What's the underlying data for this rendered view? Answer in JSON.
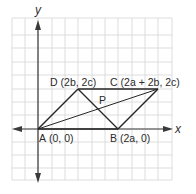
{
  "diagram": {
    "type": "coordinate-plane-parallelogram",
    "axes": {
      "x_label": "x",
      "y_label": "y"
    },
    "points": [
      {
        "id": "A",
        "name": "A",
        "coords": "(0, 0)"
      },
      {
        "id": "B",
        "name": "B",
        "coords": "(2a, 0)"
      },
      {
        "id": "C",
        "name": "C",
        "coords": "(2a + 2b, 2c)"
      },
      {
        "id": "D",
        "name": "D",
        "coords": "(2b, 2c)"
      },
      {
        "id": "P",
        "name": "P",
        "coords": ""
      }
    ],
    "segments": [
      "AB",
      "BC",
      "CD",
      "DA",
      "AC",
      "BD"
    ],
    "colors": {
      "grid": "#cfcfcf",
      "axis": "#3a3a3a",
      "shape": "#2a2a2a",
      "background": "#ffffff"
    }
  }
}
